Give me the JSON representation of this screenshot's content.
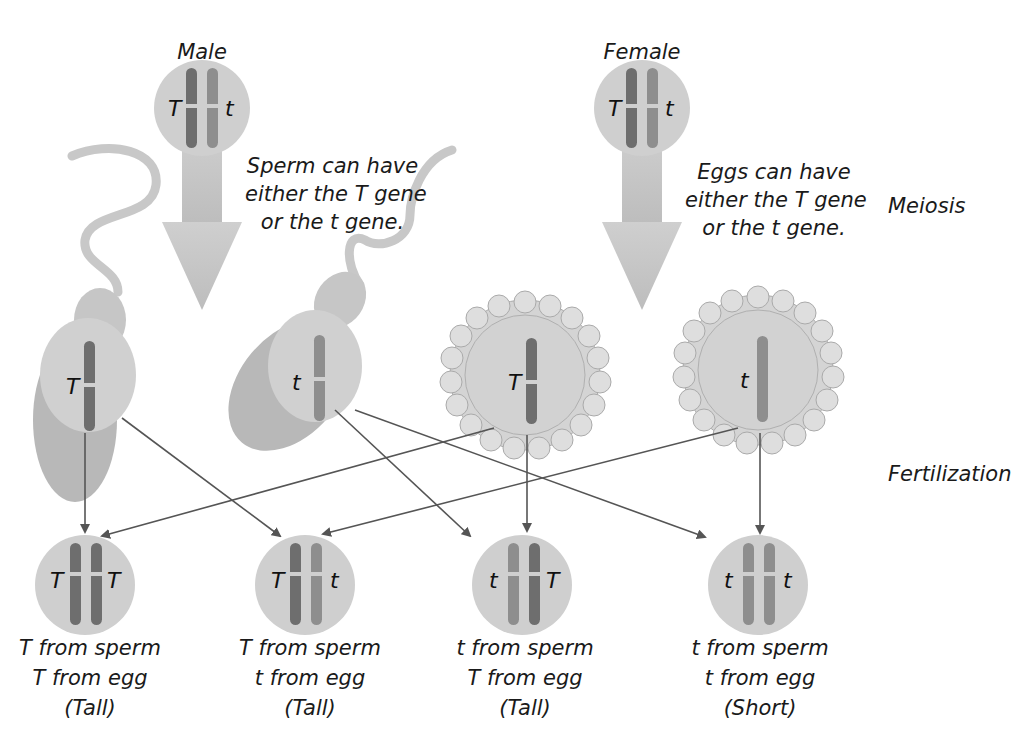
{
  "parents": {
    "male": {
      "label": "Male",
      "alleles": [
        "T",
        "t"
      ]
    },
    "female": {
      "label": "Female",
      "alleles": [
        "T",
        "t"
      ]
    }
  },
  "captions": {
    "sperm": [
      "Sperm can have",
      "either the T gene",
      "or the t gene."
    ],
    "eggs": [
      "Eggs can have",
      "either the T gene",
      "or the t gene."
    ]
  },
  "stages": {
    "meiosis": "Meiosis",
    "fertilization": "Fertilization"
  },
  "gametes": {
    "sperm": [
      {
        "allele": "T"
      },
      {
        "allele": "t"
      }
    ],
    "eggs": [
      {
        "allele": "T"
      },
      {
        "allele": "t"
      }
    ]
  },
  "offspring": [
    {
      "alleles": [
        "T",
        "T"
      ],
      "lines": [
        "T from sperm",
        "T from egg",
        "(Tall)"
      ]
    },
    {
      "alleles": [
        "T",
        "t"
      ],
      "lines": [
        "T from sperm",
        "t from egg",
        "(Tall)"
      ]
    },
    {
      "alleles": [
        "t",
        "T"
      ],
      "lines": [
        "t from sperm",
        "T from egg",
        "(Tall)"
      ]
    },
    {
      "alleles": [
        "t",
        "t"
      ],
      "lines": [
        "t from sperm",
        "t from egg",
        "(Short)"
      ]
    }
  ],
  "colors": {
    "cell": "#cfcfcf",
    "dominant_chromosome": "#6e6e6e",
    "recessive_chromosome": "#8e8e8e",
    "arrow": "#555555",
    "big_arrow": "#c4c4c4"
  }
}
